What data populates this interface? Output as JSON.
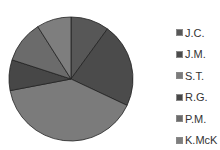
{
  "chart_data": {
    "type": "pie",
    "title": "",
    "categories": [
      "J.C.",
      "J.M.",
      "S.T.",
      "R.G.",
      "P.M.",
      "K.McK"
    ],
    "values": [
      10,
      22,
      40,
      8,
      11,
      9
    ],
    "colors": [
      "#575757",
      "#4b4b4b",
      "#7b7b7b",
      "#474747",
      "#6b6b6b",
      "#7e7e7e"
    ],
    "start_angle": "12 o'clock, clockwise",
    "legend_position": "right"
  },
  "legend": {
    "items": [
      {
        "label": "J.C."
      },
      {
        "label": "J.M."
      },
      {
        "label": "S.T."
      },
      {
        "label": "R.G."
      },
      {
        "label": "P.M."
      },
      {
        "label": "K.McK"
      }
    ]
  }
}
